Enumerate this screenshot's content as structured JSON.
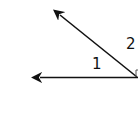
{
  "diagram": {
    "type": "angle-diagram",
    "labels": {
      "angle1": "1",
      "angle2": "2"
    },
    "rays": [
      {
        "name": "horizontal-ray",
        "from": [
          137,
          77
        ],
        "to": [
          39,
          77
        ]
      },
      {
        "name": "diagonal-ray",
        "from": [
          137,
          77
        ],
        "to": [
          58,
          13
        ]
      }
    ],
    "colors": {
      "line": "#111111",
      "background": "#ffffff"
    }
  }
}
